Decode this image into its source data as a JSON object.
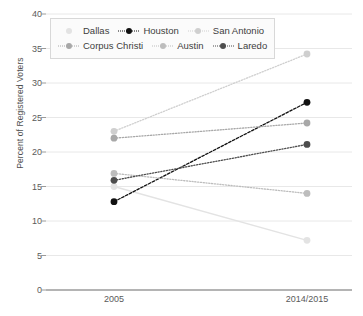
{
  "chart_data": {
    "type": "line",
    "title": "",
    "xlabel": "",
    "ylabel": "Percent of Registered Voters",
    "categories": [
      "2005",
      "2014/2015"
    ],
    "x": [
      0,
      1
    ],
    "ylim": [
      0,
      40
    ],
    "yticks": [
      0,
      5,
      10,
      15,
      20,
      25,
      30,
      35,
      40
    ],
    "grid": "horizontal",
    "legend_position": "top-left-inside",
    "series": [
      {
        "name": "Dallas",
        "values": [
          15.0,
          7.2
        ],
        "color": "#e3e3e3",
        "linestyle": "solid",
        "marker": "circle"
      },
      {
        "name": "Houston",
        "values": [
          12.8,
          27.2
        ],
        "color": "#111111",
        "linestyle": "dashed",
        "marker": "circle"
      },
      {
        "name": "San Antonio",
        "values": [
          23.0,
          34.2
        ],
        "color": "#cfcfcf",
        "linestyle": "dotted",
        "marker": "circle"
      },
      {
        "name": "Corpus Christi",
        "values": [
          22.0,
          24.2
        ],
        "color": "#a8a8a8",
        "linestyle": "dotted",
        "marker": "circle"
      },
      {
        "name": "Austin",
        "values": [
          16.9,
          14.0
        ],
        "color": "#bdbdbd",
        "linestyle": "dotted",
        "marker": "circle"
      },
      {
        "name": "Laredo",
        "values": [
          15.9,
          21.1
        ],
        "color": "#4d4d4d",
        "linestyle": "dotted",
        "marker": "circle"
      }
    ]
  },
  "axis": {
    "y_tick_labels": [
      "0",
      "5",
      "10",
      "15",
      "20",
      "25",
      "30",
      "35",
      "40"
    ],
    "x_tick_labels": [
      "2005",
      "2014/2015"
    ],
    "y_title": "Percent of Registered Voters"
  },
  "legend": {
    "rows": [
      [
        "Dallas",
        "Houston",
        "San Antonio"
      ],
      [
        "Corpus Christi",
        "Austin",
        "Laredo"
      ]
    ]
  },
  "colors": {
    "gridline": "#e8e8e8",
    "axis": "#6b6b6b",
    "text": "#4a4a4a",
    "background": "#ffffff"
  }
}
